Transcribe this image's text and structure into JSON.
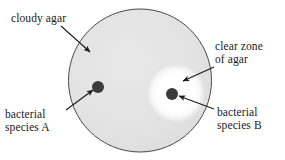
{
  "figure": {
    "background_color": "#ffffff"
  },
  "labels": {
    "cloudy_agar": {
      "name": "cloudy-agar-label",
      "lines": [
        "cloudy agar"
      ],
      "line1": "cloudy agar"
    },
    "clear_zone": {
      "name": "clear-zone-of-agar-label",
      "lines": [
        "clear zone",
        "of agar"
      ],
      "line1": "clear zone",
      "line2": "of agar"
    },
    "species_a": {
      "name": "bacterial-species-a-label",
      "lines": [
        "bacterial",
        "species A"
      ],
      "line1": "bacterial",
      "line2": "species A"
    },
    "species_b": {
      "name": "bacterial-species-b-label",
      "lines": [
        "bacterial",
        "species B"
      ],
      "line1": "bacterial",
      "line2": "species B"
    }
  },
  "diagram": {
    "agar_plate": {
      "name": "agar-plate-circle",
      "center_x": 140,
      "center_y": 80.5,
      "radius": 72,
      "fill_color": "#e3e3e3",
      "stroke_color": "#4a4a4a",
      "stroke_width": 1
    },
    "clear_zone": {
      "name": "clear-zone-blob",
      "center_x": 176,
      "center_y": 93,
      "radius": 29,
      "fill_color": "#ffffff",
      "edge_softness": "gradient"
    },
    "colony_a": {
      "name": "bacterial-colony-a-dot",
      "center_x": 98,
      "center_y": 87,
      "radius": 6,
      "fill_color": "#3b3b3b"
    },
    "colony_b": {
      "name": "bacterial-colony-b-dot",
      "center_x": 172,
      "center_y": 94,
      "radius": 6,
      "fill_color": "#3b3b3b"
    },
    "arrows": [
      {
        "name": "arrow-to-cloudy-agar",
        "from_x": 61,
        "from_y": 26,
        "to_x": 91,
        "to_y": 53,
        "color": "#1a1a1a"
      },
      {
        "name": "arrow-to-clear-zone",
        "from_x": 214,
        "from_y": 67,
        "to_x": 182,
        "to_y": 80,
        "color": "#1a1a1a"
      },
      {
        "name": "arrow-to-species-a",
        "from_x": 66,
        "from_y": 110,
        "to_x": 94,
        "to_y": 90,
        "color": "#1a1a1a"
      },
      {
        "name": "arrow-to-species-b",
        "from_x": 214,
        "from_y": 109,
        "to_x": 178,
        "to_y": 96,
        "color": "#1a1a1a"
      }
    ]
  }
}
